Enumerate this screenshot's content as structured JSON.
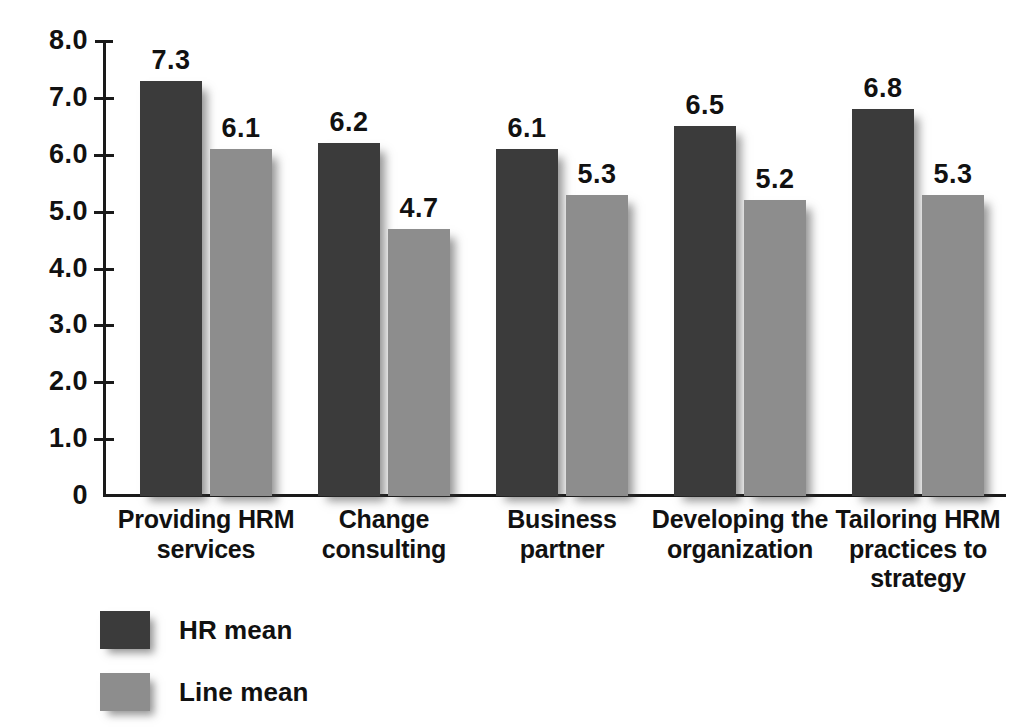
{
  "chart_data": {
    "type": "bar",
    "title": "",
    "subtitle": "",
    "xlabel": "",
    "ylabel": "",
    "ylim": [
      0,
      8.0
    ],
    "grid": false,
    "legend_position": "bottom-left",
    "y_ticks": [
      "8.0",
      "7.0",
      "6.0",
      "5.0",
      "4.0",
      "3.0",
      "2.0",
      "1.0",
      "0"
    ],
    "y_tick_values": [
      8.0,
      7.0,
      6.0,
      5.0,
      4.0,
      3.0,
      2.0,
      1.0,
      0
    ],
    "categories": [
      "Providing HRM services",
      "Change consulting",
      "Business partner",
      "Developing the organization",
      "Tailoring HRM practices to strategy"
    ],
    "category_lines": [
      [
        "Providing HRM",
        "services"
      ],
      [
        "Change",
        "consulting"
      ],
      [
        "Business",
        "partner"
      ],
      [
        "Developing the",
        "organization"
      ],
      [
        "Tailoring HRM",
        "practices to",
        "strategy"
      ]
    ],
    "series": [
      {
        "name": "HR mean",
        "color": "#3b3b3b",
        "values": [
          7.3,
          6.2,
          6.1,
          6.5,
          6.8
        ],
        "labels": [
          "7.3",
          "6.2",
          "6.1",
          "6.5",
          "6.8"
        ]
      },
      {
        "name": "Line mean",
        "color": "#8d8d8d",
        "values": [
          6.1,
          4.7,
          5.3,
          5.2,
          5.3
        ],
        "labels": [
          "6.1",
          "4.7",
          "5.3",
          "5.2",
          "5.3"
        ]
      }
    ]
  },
  "legend": {
    "items": [
      {
        "label": "HR mean",
        "color": "#3b3b3b"
      },
      {
        "label": "Line mean",
        "color": "#8d8d8d"
      }
    ]
  },
  "colors": {
    "background": "#ffffff",
    "axis": "#1a1a1a",
    "text": "#111111",
    "hr_mean": "#3b3b3b",
    "line_mean": "#8d8d8d"
  }
}
